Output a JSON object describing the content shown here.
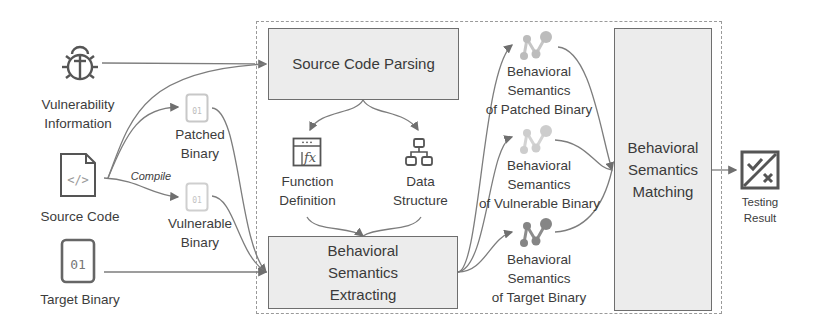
{
  "inputs": {
    "vulnerability_info": {
      "line1": "Vulnerability",
      "line2": "Information",
      "icon": "bug-icon"
    },
    "source_code": {
      "label": "Source Code",
      "icon": "code-file-icon"
    },
    "target_binary": {
      "label": "Target Binary",
      "icon": "binary-file-icon",
      "glyph": "01"
    }
  },
  "compile": {
    "label": "Compile",
    "patched_binary": {
      "line1": "Patched",
      "line2": "Binary",
      "glyph": "01"
    },
    "vulnerable_binary": {
      "line1": "Vulnerable",
      "line2": "Binary",
      "glyph": "01"
    }
  },
  "pipeline": {
    "parsing": {
      "label": "Source Code Parsing"
    },
    "function_definition": {
      "line1": "Function",
      "line2": "Definition",
      "icon": "function-icon"
    },
    "data_structure": {
      "line1": "Data",
      "line2": "Structure",
      "icon": "hierarchy-icon"
    },
    "extracting": {
      "line1": "Behavioral",
      "line2": "Semantics",
      "line3": "Extracting"
    },
    "semantics_patched": {
      "line1": "Behavioral",
      "line2": "Semantics",
      "line3": "of Patched Binary"
    },
    "semantics_vulnerable": {
      "line1": "Behavioral",
      "line2": "Semantics",
      "line3": "of Vulnerable Binary"
    },
    "semantics_target": {
      "line1": "Behavioral",
      "line2": "Semantics",
      "line3": "of Target Binary"
    },
    "matching": {
      "line1": "Behavioral",
      "line2": "Semantics",
      "line3": "Matching"
    }
  },
  "output": {
    "line1": "Testing",
    "line2": "Result",
    "icon": "check-cross-icon"
  },
  "colors": {
    "box_fill": "#ececec",
    "box_border": "#6e6e6e",
    "arrow": "#7a7a7a",
    "faded_icon": "#bdbdbd",
    "graph_node_patched": "#b5b5b5",
    "graph_node_target": "#8a8a8a"
  }
}
